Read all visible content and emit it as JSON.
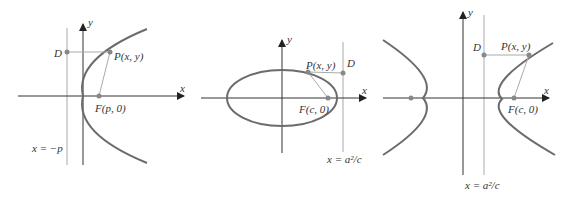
{
  "figures": [
    {
      "type": "parabola",
      "axis_labels": {
        "x": "x",
        "y": "y"
      },
      "points": {
        "D": "D",
        "P": "P(x, y)",
        "F": "F(p, 0)"
      },
      "directrix_label": "x = −p"
    },
    {
      "type": "ellipse",
      "axis_labels": {
        "x": "x",
        "y": "y"
      },
      "points": {
        "D": "D",
        "P": "P(x, y)",
        "F": "F(c, 0)"
      },
      "directrix_label": "x = a²/c"
    },
    {
      "type": "hyperbola",
      "axis_labels": {
        "x": "x",
        "y": "y"
      },
      "points": {
        "D": "D",
        "P": "P(x, y)",
        "F": "F(c, 0)"
      },
      "directrix_label": "x = a²/c"
    }
  ],
  "colors": {
    "curve": "#6b6b6b",
    "axis": "#333333",
    "guide": "#aaaaaa",
    "point": "#888888"
  }
}
